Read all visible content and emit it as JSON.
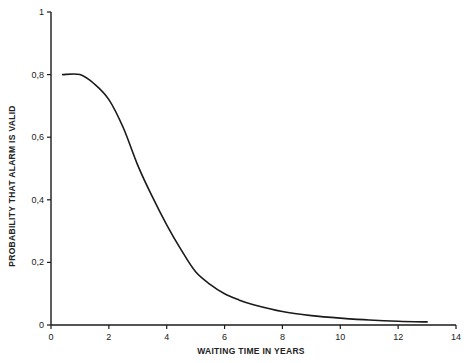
{
  "chart_data": {
    "type": "line",
    "title": "",
    "xlabel": "WAITING TIME IN YEARS",
    "ylabel": "PROBABILITY THAT ALARM IS VALID",
    "xlim": [
      0,
      14
    ],
    "ylim": [
      0,
      1
    ],
    "x_ticks": [
      0,
      2,
      4,
      6,
      8,
      10,
      12,
      14
    ],
    "x_tick_labels": [
      "0",
      "2",
      "4",
      "6",
      "8",
      "10",
      "12",
      "14"
    ],
    "y_ticks": [
      0,
      0.2,
      0.4,
      0.6,
      0.8,
      1
    ],
    "y_tick_labels": [
      "0",
      "0,2",
      "0,4",
      "0,6",
      "0,8",
      "1"
    ],
    "grid": false,
    "legend": null,
    "series": [
      {
        "name": "Probability alarm is valid",
        "color": "#1a1a1a",
        "x": [
          0.4,
          1.0,
          1.5,
          2.0,
          2.5,
          3.0,
          3.5,
          4.0,
          4.5,
          5.0,
          5.5,
          6.0,
          6.5,
          7.0,
          8.0,
          9.0,
          10.0,
          11.0,
          12.0,
          13.0
        ],
        "y": [
          0.8,
          0.8,
          0.77,
          0.72,
          0.63,
          0.51,
          0.41,
          0.32,
          0.24,
          0.17,
          0.13,
          0.1,
          0.08,
          0.065,
          0.043,
          0.03,
          0.022,
          0.016,
          0.012,
          0.01
        ]
      }
    ]
  }
}
